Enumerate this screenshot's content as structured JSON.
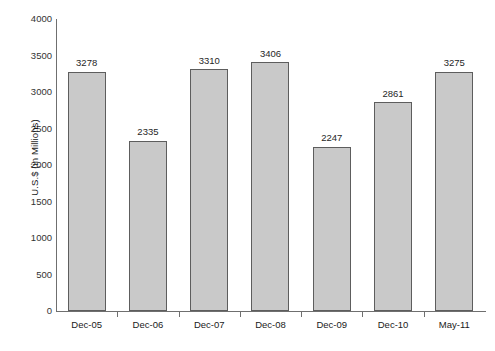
{
  "chart_data": {
    "type": "bar",
    "title": "",
    "xlabel": "",
    "ylabel": "U.S.$ (in Millions)",
    "categories": [
      "Dec-05",
      "Dec-06",
      "Dec-07",
      "Dec-08",
      "Dec-09",
      "Dec-10",
      "May-11"
    ],
    "values": [
      3278,
      2335,
      3310,
      3406,
      2247,
      2861,
      3275
    ],
    "value_labels": [
      "3278",
      "2335",
      "3310",
      "3406",
      "2247",
      "2861",
      "3275"
    ],
    "ylim": [
      0,
      4000
    ],
    "ytick_labels": [
      "4000",
      "3500",
      "3000",
      "2500",
      "2000",
      "1500",
      "1000",
      "500",
      "0"
    ],
    "ytick_values": [
      4000,
      3500,
      3000,
      2500,
      2000,
      1500,
      1000,
      500,
      0
    ],
    "grid": false,
    "legend": null,
    "bar_color": "#c9c9c9",
    "bar_border_color": "#5d5d5d",
    "axis_color": "#6f6f6f",
    "background": "#ffffff"
  }
}
